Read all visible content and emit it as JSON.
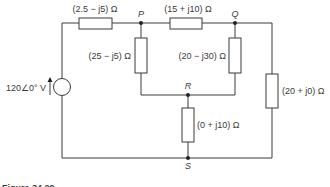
{
  "figure": {
    "caption": "Figure 34.29",
    "source": {
      "label": "120∠0° V",
      "type": "voltage-source",
      "magnitude": "120",
      "angle": "0°",
      "unit": "V"
    },
    "nodes": {
      "P": "P",
      "Q": "Q",
      "R": "R",
      "S": "S"
    },
    "impedances": {
      "z_source_p": "(2.5 − j5) Ω",
      "z_pq": "(15 + j10) Ω",
      "z_pr": "(25 − j5) Ω",
      "z_qr": "(20 − j30) Ω",
      "z_qs": "(20 + j0) Ω",
      "z_rs": "(0 + j10) Ω"
    }
  },
  "colors": {
    "line": "#3a3a3a",
    "background": "#ffffff"
  }
}
